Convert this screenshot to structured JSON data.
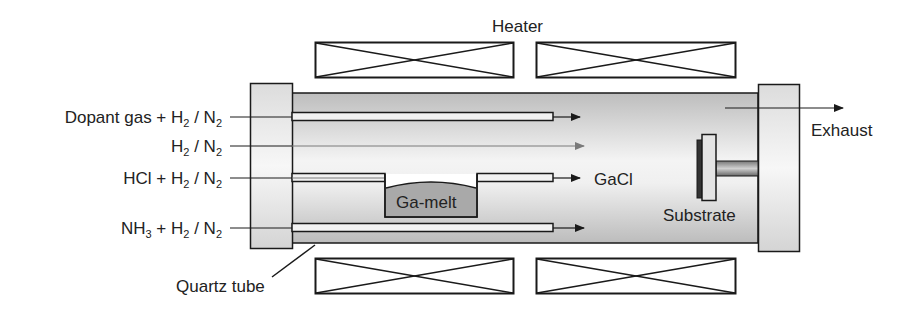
{
  "labels": {
    "heater": "Heater",
    "exhaust": "Exhaust",
    "quartz_tube": "Quartz tube",
    "ga_melt": "Ga-melt",
    "gacl": "GaCl",
    "substrate": "Substrate"
  },
  "inlets": [
    {
      "id": "dopant",
      "prefix": "Dopant gas + H",
      "s1": "2",
      "mid": " / N",
      "s2": "2"
    },
    {
      "id": "carrier",
      "prefix": "H",
      "s1": "2",
      "mid": " / N",
      "s2": "2"
    },
    {
      "id": "hcl",
      "prefix": "HCl + H",
      "s1": "2",
      "mid": " / N",
      "s2": "2"
    },
    {
      "id": "nh3",
      "prefix": "NH",
      "s0": "3",
      "prefix2": " + H",
      "s1": "2",
      "mid": " / N",
      "s2": "2"
    }
  ],
  "colors": {
    "stroke": "#1a1a1a",
    "tube_gray": "#c8c8c8",
    "flange_fill": "#e6e6e6",
    "melt_fill": "#a9a9a9",
    "arrow_gray": "#7a7a7a"
  }
}
